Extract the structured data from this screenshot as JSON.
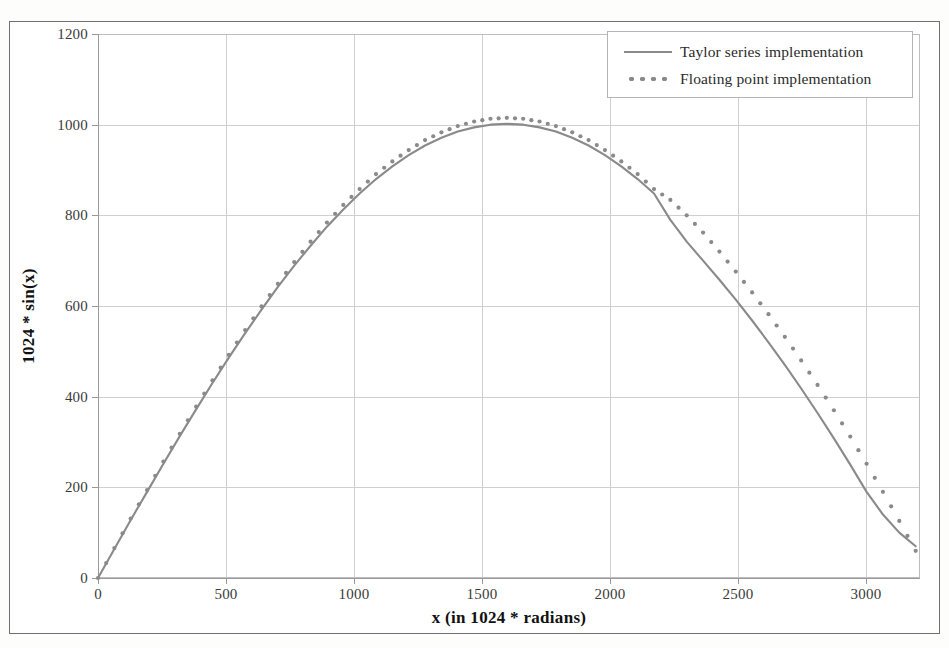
{
  "figure": {
    "background_color": "#ffffff",
    "frame_color": "#6f6f6f",
    "series_color": "#8a8a8a",
    "grid_color": "#cfcfcf"
  },
  "legend": {
    "position": "top-right",
    "entries": [
      {
        "label": "Taylor series implementation",
        "style": "solid-line",
        "key_name": "legend-key-solid"
      },
      {
        "label": "Floating point implementation",
        "style": "dotted-line",
        "key_name": "legend-key-dotted"
      }
    ]
  },
  "axes": {
    "ylabel": "1024 * sin(x)",
    "xlabel": "x (in 1024 * radians)",
    "yticks": [
      "0",
      "200",
      "400",
      "600",
      "800",
      "1000",
      "1200"
    ],
    "xticks": [
      "0",
      "500",
      "1000",
      "1500",
      "2000",
      "2500",
      "3000"
    ]
  },
  "chart_data": {
    "type": "line",
    "title": "",
    "xlabel": "x (in 1024 * radians)",
    "ylabel": "1024 * sin(x)",
    "xlim": [
      0,
      3217
    ],
    "ylim": [
      0,
      1200
    ],
    "grid": true,
    "legend_position": "top-right",
    "x": [
      0,
      64,
      128,
      192,
      256,
      320,
      384,
      448,
      512,
      576,
      640,
      704,
      768,
      832,
      896,
      960,
      1024,
      1088,
      1152,
      1216,
      1280,
      1344,
      1408,
      1472,
      1536,
      1600,
      1664,
      1728,
      1792,
      1856,
      1920,
      1984,
      2048,
      2112,
      2176,
      2240,
      2304,
      2368,
      2432,
      2496,
      2560,
      2624,
      2688,
      2752,
      2816,
      2880,
      2944,
      3008,
      3072,
      3136,
      3200
    ],
    "series": [
      {
        "name": "Taylor series implementation",
        "style": "solid",
        "values": [
          0,
          64,
          128,
          190,
          252,
          313,
          372,
          430,
          486,
          540,
          592,
          642,
          689,
          733,
          775,
          813,
          848,
          880,
          908,
          933,
          954,
          971,
          985,
          994,
          1000,
          1002,
          1000,
          994,
          985,
          971,
          954,
          933,
          908,
          880,
          848,
          790,
          742,
          700,
          658,
          614,
          568,
          520,
          470,
          418,
          364,
          308,
          250,
          190,
          140,
          100,
          70
        ]
      },
      {
        "name": "Floating point implementation",
        "style": "dotted",
        "values": [
          0,
          66,
          131,
          194,
          257,
          318,
          378,
          436,
          492,
          547,
          599,
          649,
          697,
          742,
          784,
          823,
          858,
          891,
          919,
          944,
          966,
          983,
          997,
          1007,
          1013,
          1015,
          1013,
          1007,
          997,
          983,
          966,
          944,
          919,
          891,
          858,
          834,
          800,
          762,
          720,
          676,
          630,
          582,
          532,
          480,
          426,
          370,
          312,
          252,
          190,
          126,
          60
        ]
      }
    ]
  }
}
